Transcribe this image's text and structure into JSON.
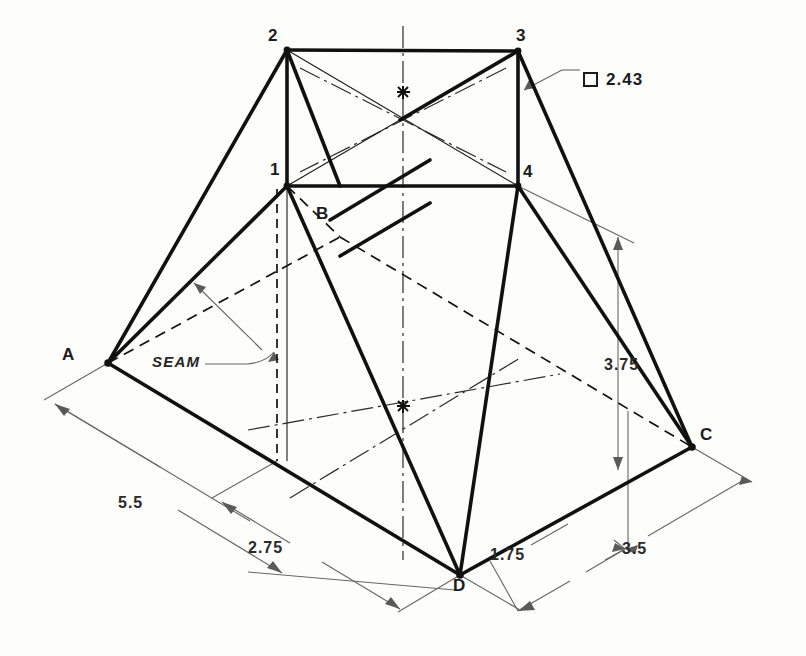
{
  "drawing": {
    "type": "isometric-technical-drawing",
    "description": "Isometric pictorial of a transition piece (square-to-rectangle hopper) with seam and dimensions",
    "colors": {
      "object_line": "#111111",
      "hidden_line": "#111111",
      "center_line": "#333333",
      "dimension_line": "#5a5a5a",
      "background": "#fdfdfc",
      "text": "#1c1c1c"
    },
    "vertex_labels": [
      {
        "name": "vertex-2",
        "text": "2",
        "x": 268,
        "y": 32
      },
      {
        "name": "vertex-3",
        "text": "3",
        "x": 516,
        "y": 32
      },
      {
        "name": "vertex-1",
        "text": "1",
        "x": 268,
        "y": 164
      },
      {
        "name": "vertex-4",
        "text": "4",
        "x": 523,
        "y": 166
      },
      {
        "name": "vertex-B",
        "text": "B",
        "x": 317,
        "y": 208
      },
      {
        "name": "vertex-A",
        "text": "A",
        "x": 62,
        "y": 348
      },
      {
        "name": "vertex-C",
        "text": "C",
        "x": 700,
        "y": 428
      },
      {
        "name": "vertex-D",
        "text": "D",
        "x": 455,
        "y": 578
      }
    ],
    "annotations": [
      {
        "name": "seam-label",
        "text": "SEAM",
        "x": 155,
        "y": 348
      },
      {
        "name": "square-note",
        "text": "2.43",
        "x": 605,
        "y": 66
      }
    ],
    "dimensions": [
      {
        "name": "dim-5-5",
        "text": "5.5",
        "x": 118,
        "y": 496,
        "value": 5.5
      },
      {
        "name": "dim-2-75",
        "text": "2.75",
        "x": 250,
        "y": 541,
        "value": 2.75
      },
      {
        "name": "dim-1-75",
        "text": "1.75",
        "x": 492,
        "y": 548,
        "value": 1.75
      },
      {
        "name": "dim-3-5",
        "text": "3.5",
        "x": 624,
        "y": 542,
        "value": 3.5
      },
      {
        "name": "dim-3-75",
        "text": "3.75",
        "x": 606,
        "y": 358,
        "value": 3.75
      }
    ],
    "square_symbol": {
      "name": "square-symbol",
      "x": 583,
      "y": 66
    },
    "geometry": {
      "top_rect": {
        "p2": [
          287,
          50
        ],
        "p3": [
          518,
          51
        ],
        "p4": [
          518,
          186
        ],
        "p1": [
          287,
          186
        ]
      },
      "base_rect": {
        "A": [
          108,
          363
        ],
        "D": [
          460,
          575
        ],
        "C": [
          692,
          447
        ],
        "B_hidden": [
          340,
          237
        ]
      },
      "seam_line": {
        "from": [
          277,
          190
        ],
        "to": [
          277,
          461
        ]
      }
    }
  }
}
